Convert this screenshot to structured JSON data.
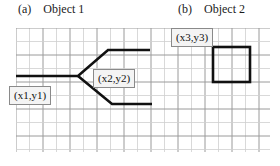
{
  "figure": {
    "width": 280,
    "height": 166,
    "background": "#ffffff"
  },
  "panels": [
    {
      "tag": "(a)",
      "title": "Object 1"
    },
    {
      "tag": "(b)",
      "title": "Object 2"
    }
  ],
  "grid": {
    "line_color_minor": "#cfcfcf",
    "line_color_major": "#9a9a9a",
    "cell_size": 13.5,
    "columns": 19,
    "rows": 9,
    "origin_x": 16,
    "origin_y": 28,
    "width": 254,
    "height": 124
  },
  "shapes": {
    "stroke_color": "#111111",
    "stroke_width": 2.6,
    "object1": {
      "name": "Object 1",
      "type": "branching-polyline",
      "branches": [
        {
          "name": "trunk-and-upper-branch",
          "points": "16,76 78,76 108,50 150,50"
        },
        {
          "name": "lower-branch",
          "points": "78,76 112,104 152,104"
        }
      ]
    },
    "object2": {
      "name": "Object 2",
      "type": "rectangle",
      "x": 213,
      "y": 47,
      "width": 37,
      "height": 35
    }
  },
  "labels": {
    "xy1": "(x1,y1)",
    "xy2": "(x2,y2)",
    "xy3": "(x3,y3)",
    "box_fill": "#f4f4f4",
    "box_border": "#8a8a8a"
  }
}
